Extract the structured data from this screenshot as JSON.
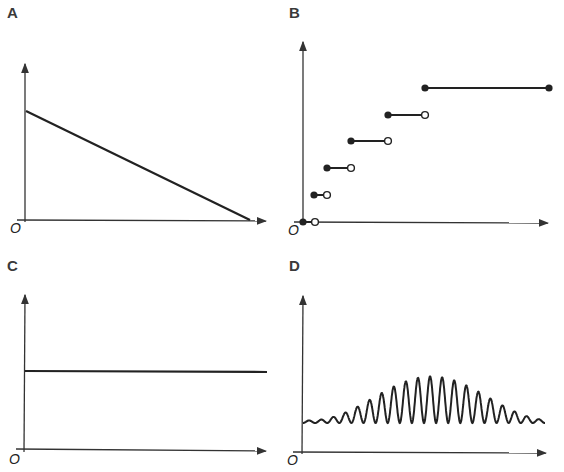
{
  "panels": [
    {
      "id": "A",
      "label": "A",
      "origin_label": "O",
      "type": "line",
      "description": "decreasing linear line from y-axis intercept to x-axis"
    },
    {
      "id": "B",
      "label": "B",
      "origin_label": "O",
      "type": "step",
      "description": "increasing step function with widening steps, filled left endpoints, open right endpoints"
    },
    {
      "id": "C",
      "label": "C",
      "origin_label": "O",
      "type": "line",
      "description": "constant horizontal line"
    },
    {
      "id": "D",
      "label": "D",
      "origin_label": "O",
      "type": "line",
      "description": "oscillation with amplitude envelope rising then falling"
    }
  ],
  "colors": {
    "axis": "#333333",
    "curve": "#222222",
    "label": "#3a3a3a",
    "background": "#ffffff"
  },
  "chart_data": [
    {
      "type": "line",
      "title": "A",
      "xlabel": "",
      "ylabel": "",
      "x": [
        0,
        1
      ],
      "values": [
        1,
        0
      ],
      "note": "straight line from (0, ~0.7 of axis height) down to x-axis intercept"
    },
    {
      "type": "line",
      "title": "B",
      "xlabel": "",
      "ylabel": "",
      "steps": [
        {
          "x_start": 0,
          "x_end": 1,
          "y": 0,
          "start_closed": true,
          "end_closed": false
        },
        {
          "x_start": 1,
          "x_end": 2,
          "y": 1,
          "start_closed": true,
          "end_closed": false
        },
        {
          "x_start": 2,
          "x_end": 4,
          "y": 2,
          "start_closed": true,
          "end_closed": false
        },
        {
          "x_start": 4,
          "x_end": 7,
          "y": 3,
          "start_closed": true,
          "end_closed": false
        },
        {
          "x_start": 7,
          "x_end": 10,
          "y": 4,
          "start_closed": true,
          "end_closed": false
        },
        {
          "x_start": 10,
          "x_end": 20,
          "y": 5,
          "start_closed": true,
          "end_closed": true
        }
      ]
    },
    {
      "type": "line",
      "title": "C",
      "xlabel": "",
      "ylabel": "",
      "x": [
        0,
        1
      ],
      "values": [
        0.5,
        0.5
      ]
    },
    {
      "type": "line",
      "title": "D",
      "xlabel": "",
      "ylabel": "",
      "oscillation": {
        "cycles": 20,
        "baseline": 0.2,
        "max_amplitude": 0.3,
        "envelope": "rises to peak near middle then falls"
      }
    }
  ]
}
